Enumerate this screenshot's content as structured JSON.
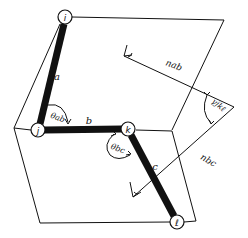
{
  "diagram": {
    "title": "",
    "colors": {
      "ink": "#111111",
      "background": "#ffffff"
    },
    "nodes": [
      {
        "id": "i",
        "label": "i",
        "x": 65,
        "y": 17
      },
      {
        "id": "j",
        "label": "j",
        "x": 38,
        "y": 130
      },
      {
        "id": "k",
        "label": "k",
        "x": 128,
        "y": 129
      },
      {
        "id": "l",
        "label": "ℓ",
        "x": 177,
        "y": 222
      }
    ],
    "bonds": [
      {
        "id": "a",
        "label": "a",
        "from": "i",
        "to": "j"
      },
      {
        "id": "b",
        "label": "b",
        "from": "j",
        "to": "k"
      },
      {
        "id": "c",
        "label": "c",
        "from": "k",
        "to": "l"
      }
    ],
    "angles": [
      {
        "id": "theta_ab",
        "label": "θab"
      },
      {
        "id": "theta_bc",
        "label": "θbc"
      },
      {
        "id": "gamma_jk",
        "label": "γjkℓ"
      }
    ],
    "normals": [
      {
        "id": "n_ab",
        "label": "nab"
      },
      {
        "id": "n_bc",
        "label": "nbc"
      }
    ]
  }
}
